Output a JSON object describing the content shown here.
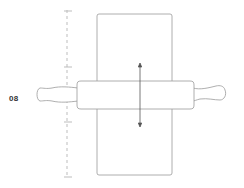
{
  "diagram": {
    "step_label": "08",
    "colors": {
      "stroke": "#9a9a9a",
      "ruler": "#bdbdbd",
      "text": "#333333",
      "background": "#ffffff"
    },
    "ruler": {
      "ticks": 4
    },
    "arrow": {
      "direction": "up-down"
    }
  }
}
